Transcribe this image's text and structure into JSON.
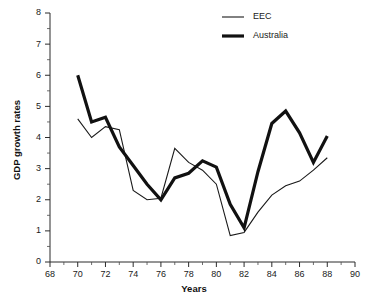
{
  "chart_data": {
    "type": "line",
    "title": "",
    "xlabel": "Years",
    "ylabel": "GDP growth rates",
    "xlim": [
      68,
      90
    ],
    "ylim": [
      0,
      8
    ],
    "x_tick_step": 2,
    "x_minor_step": 1,
    "y_tick_step": 1,
    "y_minor_step": 0.5,
    "grid": false,
    "legend_position": "top-right",
    "x_tick_labels": [
      "68",
      "70",
      "72",
      "74",
      "76",
      "78",
      "80",
      "82",
      "84",
      "86",
      "88",
      "90"
    ],
    "y_tick_labels": [
      "0",
      "1",
      "2",
      "3",
      "4",
      "5",
      "6",
      "7",
      "8"
    ],
    "x": [
      70,
      71,
      72,
      73,
      74,
      75,
      76,
      77,
      78,
      79,
      80,
      81,
      82,
      83,
      84,
      85,
      86,
      87,
      88
    ],
    "series": [
      {
        "name": "EEC",
        "stroke": "#1a1a1a",
        "width": 1.1,
        "values": [
          4.6,
          4.0,
          4.35,
          4.25,
          2.3,
          2.0,
          2.05,
          3.65,
          3.2,
          2.95,
          2.5,
          0.85,
          0.95,
          1.6,
          2.15,
          2.45,
          2.6,
          2.95,
          3.35
        ]
      },
      {
        "name": "Australia",
        "stroke": "#111111",
        "width": 3.2,
        "values": [
          6.0,
          4.5,
          4.65,
          3.7,
          3.1,
          2.5,
          2.0,
          2.7,
          2.85,
          3.25,
          3.05,
          1.85,
          1.1,
          2.9,
          4.45,
          4.85,
          4.15,
          3.2,
          4.05
        ]
      }
    ],
    "legend": [
      {
        "label": "EEC",
        "stroke": "#1a1a1a",
        "width": 1.1
      },
      {
        "label": "Australia",
        "stroke": "#111111",
        "width": 3.2
      }
    ]
  }
}
